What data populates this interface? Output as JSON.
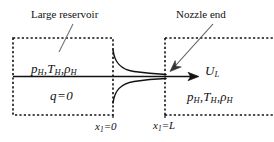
{
  "figure": {
    "type": "nozzle-flow-schematic",
    "callouts": {
      "reservoir": "Large reservoir",
      "nozzle_end": "Nozzle end"
    },
    "reservoir_region": {
      "pressure_symbol": "p",
      "pressure_sub": "H",
      "temperature_symbol": "T",
      "temperature_sub": "H",
      "density_symbol": "ρ",
      "density_sub": "H",
      "separator": ",",
      "heat_flux_symbol": "q",
      "heat_flux_equals": "=",
      "heat_flux_value": "0"
    },
    "exit_region": {
      "velocity_symbol": "U",
      "velocity_sub": "L",
      "pressure_symbol": "p",
      "pressure_sub": "H",
      "temperature_symbol": "T",
      "temperature_sub": "H",
      "density_symbol": "ρ",
      "density_sub": "H",
      "separator": ","
    },
    "axis_labels": {
      "origin_symbol": "x",
      "origin_sub": "1",
      "origin_equals": "=",
      "origin_value": "0",
      "end_symbol": "x",
      "end_sub": "1",
      "end_equals": "=",
      "end_value": "L"
    },
    "colors": {
      "stroke": "#111111",
      "background": "#ffffff",
      "leader": "#555555"
    },
    "icons": {
      "flow_arrow": "arrow-right-icon",
      "leader_reservoir": "leader-line-icon",
      "leader_nozzle": "leader-arrow-icon"
    }
  }
}
